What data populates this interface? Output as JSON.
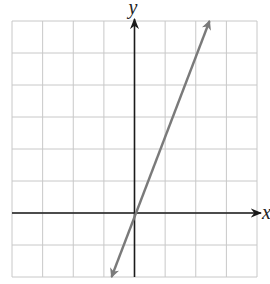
{
  "chart_data": {
    "type": "line",
    "title": "",
    "xlabel": "x",
    "ylabel": "y",
    "xlim": [
      -4,
      4
    ],
    "ylim": [
      -2,
      6
    ],
    "grid": true,
    "grid_step": 1,
    "tick_labels": false,
    "series": [
      {
        "name": "line",
        "equation": "y = 2.5x",
        "slope": 2.5,
        "intercept": 0,
        "x": [
          -0.75,
          2.45
        ],
        "y": [
          -2,
          6
        ],
        "arrows": "both",
        "color": "#7a7a7a"
      }
    ]
  },
  "colors": {
    "grid": "#c8c8c8",
    "axis": "#1a1a1a",
    "line": "#7a7a7a"
  }
}
